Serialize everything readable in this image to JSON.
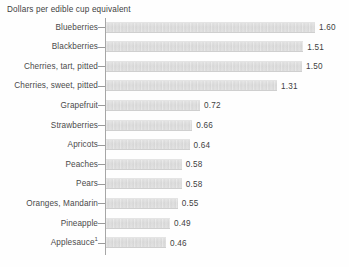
{
  "chart_data": {
    "type": "bar",
    "orientation": "horizontal",
    "title": "Dollars per edible cup equivalent",
    "xlabel": "",
    "ylabel": "",
    "grid": false,
    "legend": null,
    "xlim": [
      0,
      1.6
    ],
    "categories": [
      "Blueberries",
      "Blackberries",
      "Cherries, tart, pitted",
      "Cherries, sweet, pitted",
      "Grapefruit",
      "Strawberries",
      "Apricots",
      "Peaches",
      "Pears",
      "Oranges, Mandarin",
      "Pineapple",
      "Applesauce"
    ],
    "values": [
      1.6,
      1.51,
      1.5,
      1.31,
      0.72,
      0.66,
      0.64,
      0.58,
      0.58,
      0.55,
      0.49,
      0.46
    ],
    "value_labels": [
      "1.60",
      "1.51",
      "1.50",
      "1.31",
      "0.72",
      "0.66",
      "0.64",
      "0.58",
      "0.58",
      "0.55",
      "0.49",
      "0.46"
    ],
    "footnotes": {
      "Applesauce": "1"
    },
    "colors": {
      "bar_fill": "#d6d6d6",
      "bar_edge": "#cfcfcf",
      "axis": "#a6a6a6",
      "text": "#4a4a4a",
      "title_text": "#3e3e3e",
      "value_text": "#3f3f3f",
      "background": "#fefefe"
    }
  },
  "rows": [
    {
      "label": "Blueberries",
      "value_label": "1.60",
      "footnote": ""
    },
    {
      "label": "Blackberries",
      "value_label": "1.51",
      "footnote": ""
    },
    {
      "label": "Cherries, tart, pitted",
      "value_label": "1.50",
      "footnote": ""
    },
    {
      "label": "Cherries, sweet, pitted",
      "value_label": "1.31",
      "footnote": ""
    },
    {
      "label": "Grapefruit",
      "value_label": "0.72",
      "footnote": ""
    },
    {
      "label": "Strawberries",
      "value_label": "0.66",
      "footnote": ""
    },
    {
      "label": "Apricots",
      "value_label": "0.64",
      "footnote": ""
    },
    {
      "label": "Peaches",
      "value_label": "0.58",
      "footnote": ""
    },
    {
      "label": "Pears",
      "value_label": "0.58",
      "footnote": ""
    },
    {
      "label": "Oranges, Mandarin",
      "value_label": "0.55",
      "footnote": ""
    },
    {
      "label": "Pineapple",
      "value_label": "0.49",
      "footnote": ""
    },
    {
      "label": "Applesauce",
      "value_label": "0.46",
      "footnote": "1"
    }
  ]
}
